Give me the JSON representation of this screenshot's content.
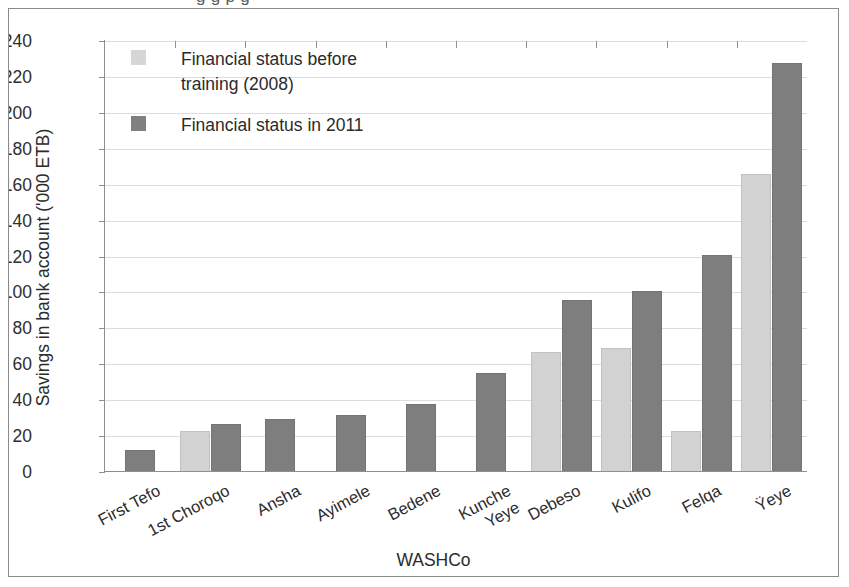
{
  "figure": {
    "cut_off_caption": "g      g       p g",
    "frame_border_color": "#8a8a8a",
    "background": "#ffffff"
  },
  "legend": {
    "position": "top-left-inside-plot",
    "entries": [
      {
        "label": "Financial status before\ntraining (2008)",
        "color": "#d6d6d6",
        "swatch_name": "legend-swatch-2008"
      },
      {
        "label": "Financial status in 2011",
        "color": "#808080",
        "swatch_name": "legend-swatch-2011"
      }
    ]
  },
  "chart_data": {
    "type": "bar",
    "title": "",
    "xlabel": "WASHCo",
    "ylabel": "Savings in bank account ('000 ETB)",
    "ylim": [
      0,
      240
    ],
    "ytick_step": 20,
    "yticks": [
      "240",
      "220",
      "200",
      "180",
      "160",
      "140",
      "120",
      "100",
      "80",
      "60",
      "40",
      "20",
      "0"
    ],
    "grid": true,
    "grid_axis": "y",
    "legend_position": "upper left",
    "categories": [
      "First Tefo",
      "1st Choroqo",
      "Ansha",
      "Ayimele",
      "Bedene",
      "Kunche\nYeye",
      "Debeso",
      "Kulifo",
      "Felqa",
      "Ÿeye"
    ],
    "series": [
      {
        "name": "Financial status before training (2008)",
        "color": "#d2d2d2",
        "values": [
          null,
          23,
          null,
          null,
          null,
          null,
          67,
          69,
          23,
          166
        ]
      },
      {
        "name": "Financial status in 2011",
        "color": "#7e7e7e",
        "values": [
          12,
          27,
          29.5,
          31.5,
          38,
          55,
          96,
          101,
          121,
          228
        ]
      }
    ]
  }
}
